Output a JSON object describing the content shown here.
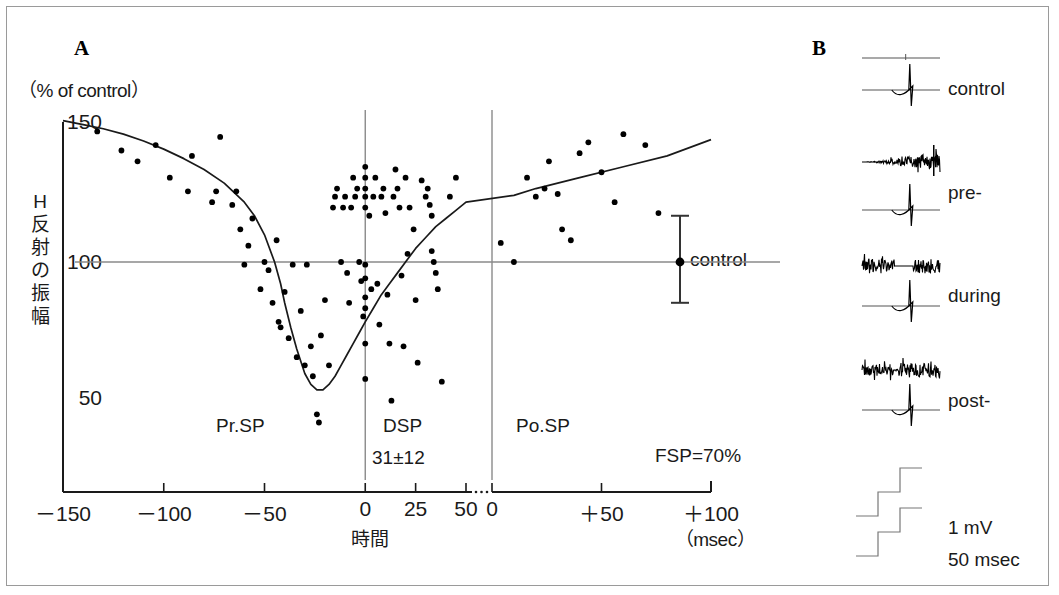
{
  "figure": {
    "panelA": {
      "letter": "A"
    },
    "panelB": {
      "letter": "B"
    }
  },
  "axes": {
    "y_unit": "（% of control）",
    "y_label_chars": [
      "H",
      "反",
      "射",
      "の",
      "振",
      "幅"
    ],
    "y_ticks": [
      "150",
      "100",
      "50"
    ],
    "x_label": "時間",
    "x_unit": "（msec）",
    "x_ticks": [
      "－150",
      "－100",
      "－50",
      "0",
      "25",
      "50",
      "0",
      "＋50",
      "＋100"
    ]
  },
  "annotations": {
    "pre_sp": "Pr.SP",
    "dsp": "DSP",
    "dsp_value": "31±12",
    "post_sp": "Po.SP",
    "fsp": "FSP=70%",
    "control_point": "control"
  },
  "traces": {
    "control": "control",
    "pre": "pre-",
    "during": "during",
    "post": "post-",
    "cal_amplitude": "1 mV",
    "cal_time": "50 msec"
  },
  "colors": {
    "axis": "#1a1a1a",
    "grid": "#8a8a8a",
    "point": "#000000",
    "curve": "#1a1a1a",
    "border": "#9a9a9a"
  },
  "chart_data": {
    "type": "scatter",
    "xlabel": "時間 (msec)",
    "ylabel": "H反射の振幅 (% of control)",
    "xlim": [
      -150,
      100
    ],
    "ylim": [
      30,
      160
    ],
    "grid": false,
    "axis_break_at": 50,
    "reference_line_y": 100,
    "vertical_markers": [
      0,
      50
    ],
    "regions": [
      {
        "name": "Pr.SP",
        "from": -150,
        "to": 0
      },
      {
        "name": "DSP",
        "from": 0,
        "to": 50,
        "duration": "31±12"
      },
      {
        "name": "Po.SP",
        "from": 50,
        "to": 100
      }
    ],
    "control_error_bar": {
      "x": 85,
      "y": 100,
      "upper": 117,
      "lower": 85
    },
    "fitted_curve": {
      "x": [
        -150,
        -140,
        -130,
        -120,
        -110,
        -100,
        -90,
        -80,
        -70,
        -60,
        -55,
        -50,
        -45,
        -42,
        -40,
        -37,
        -34,
        -30,
        -27,
        -24,
        -21,
        -18,
        -15,
        -12,
        -9,
        -6,
        -3,
        0,
        4,
        8,
        12,
        16,
        20,
        25,
        30,
        35,
        40,
        45,
        50,
        55,
        60,
        70,
        80,
        90,
        100
      ],
      "y": [
        152,
        150.5,
        149,
        147,
        144.5,
        141.5,
        138,
        134,
        129,
        122,
        117,
        110,
        100,
        92,
        85,
        76,
        68,
        59,
        55,
        53,
        53,
        55,
        58,
        62,
        66,
        70,
        74,
        78,
        83,
        88,
        92,
        96,
        100,
        105,
        109,
        113,
        116,
        119,
        122,
        124.5,
        127,
        131,
        135,
        139,
        145
      ]
    },
    "points": [
      {
        "x": -133,
        "y": 148
      },
      {
        "x": -121,
        "y": 141
      },
      {
        "x": -113,
        "y": 137
      },
      {
        "x": -104,
        "y": 143
      },
      {
        "x": -97,
        "y": 131
      },
      {
        "x": -88,
        "y": 126
      },
      {
        "x": -86,
        "y": 139
      },
      {
        "x": -76,
        "y": 122
      },
      {
        "x": -74,
        "y": 126
      },
      {
        "x": -72,
        "y": 146
      },
      {
        "x": -66,
        "y": 121
      },
      {
        "x": -64,
        "y": 126
      },
      {
        "x": -62,
        "y": 112
      },
      {
        "x": -60,
        "y": 99
      },
      {
        "x": -58,
        "y": 106
      },
      {
        "x": -56,
        "y": 116
      },
      {
        "x": -52,
        "y": 90
      },
      {
        "x": -50,
        "y": 100
      },
      {
        "x": -48,
        "y": 97
      },
      {
        "x": -46,
        "y": 85
      },
      {
        "x": -44,
        "y": 108
      },
      {
        "x": -43,
        "y": 78
      },
      {
        "x": -42,
        "y": 76
      },
      {
        "x": -40,
        "y": 89
      },
      {
        "x": -38,
        "y": 72
      },
      {
        "x": -36,
        "y": 99
      },
      {
        "x": -34,
        "y": 65
      },
      {
        "x": -32,
        "y": 82
      },
      {
        "x": -30,
        "y": 62
      },
      {
        "x": -29,
        "y": 99
      },
      {
        "x": -27,
        "y": 69
      },
      {
        "x": -26,
        "y": 58
      },
      {
        "x": -24,
        "y": 44
      },
      {
        "x": -23,
        "y": 41
      },
      {
        "x": -22,
        "y": 73
      },
      {
        "x": -20,
        "y": 86
      },
      {
        "x": -18,
        "y": 62
      },
      {
        "x": -16,
        "y": 120
      },
      {
        "x": -15,
        "y": 124
      },
      {
        "x": -14,
        "y": 127
      },
      {
        "x": -12,
        "y": 100
      },
      {
        "x": -11,
        "y": 120
      },
      {
        "x": -10,
        "y": 124
      },
      {
        "x": -9,
        "y": 96
      },
      {
        "x": -8,
        "y": 85
      },
      {
        "x": -7,
        "y": 120
      },
      {
        "x": -6,
        "y": 131
      },
      {
        "x": -5,
        "y": 124
      },
      {
        "x": -4,
        "y": 127
      },
      {
        "x": -3,
        "y": 100
      },
      {
        "x": -2,
        "y": 93
      },
      {
        "x": -1,
        "y": 80
      },
      {
        "x": 0,
        "y": 135
      },
      {
        "x": 0,
        "y": 131
      },
      {
        "x": 0,
        "y": 127
      },
      {
        "x": 0,
        "y": 124
      },
      {
        "x": 0,
        "y": 120
      },
      {
        "x": 0,
        "y": 99
      },
      {
        "x": 0,
        "y": 94
      },
      {
        "x": 0,
        "y": 87
      },
      {
        "x": 0,
        "y": 83
      },
      {
        "x": 0,
        "y": 70
      },
      {
        "x": 0,
        "y": 57
      },
      {
        "x": 2,
        "y": 117
      },
      {
        "x": 3,
        "y": 90
      },
      {
        "x": 4,
        "y": 124
      },
      {
        "x": 5,
        "y": 131
      },
      {
        "x": 6,
        "y": 92
      },
      {
        "x": 7,
        "y": 77
      },
      {
        "x": 8,
        "y": 124
      },
      {
        "x": 9,
        "y": 127
      },
      {
        "x": 10,
        "y": 118
      },
      {
        "x": 11,
        "y": 88
      },
      {
        "x": 12,
        "y": 70
      },
      {
        "x": 13,
        "y": 49
      },
      {
        "x": 14,
        "y": 124
      },
      {
        "x": 15,
        "y": 134
      },
      {
        "x": 16,
        "y": 127
      },
      {
        "x": 17,
        "y": 120
      },
      {
        "x": 18,
        "y": 95
      },
      {
        "x": 19,
        "y": 69
      },
      {
        "x": 20,
        "y": 131
      },
      {
        "x": 21,
        "y": 103
      },
      {
        "x": 22,
        "y": 120
      },
      {
        "x": 24,
        "y": 112
      },
      {
        "x": 25,
        "y": 86
      },
      {
        "x": 26,
        "y": 63
      },
      {
        "x": 28,
        "y": 130
      },
      {
        "x": 30,
        "y": 124
      },
      {
        "x": 31,
        "y": 127
      },
      {
        "x": 32,
        "y": 121
      },
      {
        "x": 33,
        "y": 117
      },
      {
        "x": 33,
        "y": 104
      },
      {
        "x": 34,
        "y": 100
      },
      {
        "x": 35,
        "y": 96
      },
      {
        "x": 36,
        "y": 90
      },
      {
        "x": 38,
        "y": 56
      },
      {
        "x": 42,
        "y": 124
      },
      {
        "x": 45,
        "y": 131
      },
      {
        "x": 52,
        "y": 107
      },
      {
        "x": 55,
        "y": 100
      },
      {
        "x": 58,
        "y": 131
      },
      {
        "x": 60,
        "y": 124
      },
      {
        "x": 62,
        "y": 127
      },
      {
        "x": 63,
        "y": 137
      },
      {
        "x": 65,
        "y": 125
      },
      {
        "x": 66,
        "y": 112
      },
      {
        "x": 68,
        "y": 108
      },
      {
        "x": 70,
        "y": 140
      },
      {
        "x": 72,
        "y": 144
      },
      {
        "x": 75,
        "y": 133
      },
      {
        "x": 78,
        "y": 122
      },
      {
        "x": 80,
        "y": 147
      },
      {
        "x": 85,
        "y": 143
      },
      {
        "x": 88,
        "y": 118
      }
    ]
  }
}
